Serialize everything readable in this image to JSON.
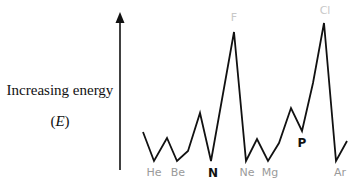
{
  "chart_data": {
    "type": "line",
    "title": "",
    "xlabel": "",
    "ylabel": "Increasing energy (E)",
    "ylabel_line1": "Increasing energy",
    "ylabel_line2_open": "(",
    "ylabel_line2_var": "E",
    "ylabel_line2_close": ")",
    "grid": false,
    "legend": "none",
    "series": [
      {
        "name": "Energy profile across elements (He to K)",
        "x": [
          "H",
          "He",
          "Li",
          "Be",
          "B",
          "C",
          "N",
          "O",
          "F",
          "Ne",
          "Na",
          "Mg",
          "Al",
          "Si",
          "P",
          "S",
          "Cl",
          "Ar",
          "K"
        ],
        "values_relative": [
          40,
          0,
          30,
          0,
          13,
          63,
          0,
          0,
          100,
          0,
          30,
          0,
          22,
          71,
          40,
          105,
          118,
          0,
          25
        ],
        "points_px": [
          [
            143,
            132
          ],
          [
            154,
            161
          ],
          [
            167,
            138
          ],
          [
            177,
            161
          ],
          [
            188,
            151
          ],
          [
            200,
            113
          ],
          [
            211,
            161
          ],
          [
            234,
            32
          ],
          [
            246,
            161
          ],
          [
            257,
            139
          ],
          [
            268,
            161
          ],
          [
            279,
            143
          ],
          [
            291,
            108
          ],
          [
            302,
            131
          ],
          [
            313,
            83
          ],
          [
            324,
            23
          ],
          [
            336,
            161
          ],
          [
            347,
            141
          ]
        ]
      }
    ],
    "labels": [
      {
        "text": "He",
        "x": 154,
        "y": 176,
        "style": "gray"
      },
      {
        "text": "Be",
        "x": 178,
        "y": 176,
        "style": "gray"
      },
      {
        "text": "N",
        "x": 213,
        "y": 177,
        "style": "bold"
      },
      {
        "text": "F",
        "x": 234,
        "y": 21,
        "style": "light"
      },
      {
        "text": "Ne",
        "x": 247,
        "y": 176,
        "style": "gray"
      },
      {
        "text": "Mg",
        "x": 270,
        "y": 176,
        "style": "gray"
      },
      {
        "text": "P",
        "x": 302,
        "y": 147,
        "style": "bold"
      },
      {
        "text": "Cl",
        "x": 325,
        "y": 14,
        "style": "light"
      },
      {
        "text": "Ar",
        "x": 340,
        "y": 176,
        "style": "gray"
      }
    ],
    "colors": {
      "line": "#111111",
      "label_gray": "#9a9a9a",
      "label_light": "#c8c8c8",
      "label_bold": "#111111"
    }
  }
}
